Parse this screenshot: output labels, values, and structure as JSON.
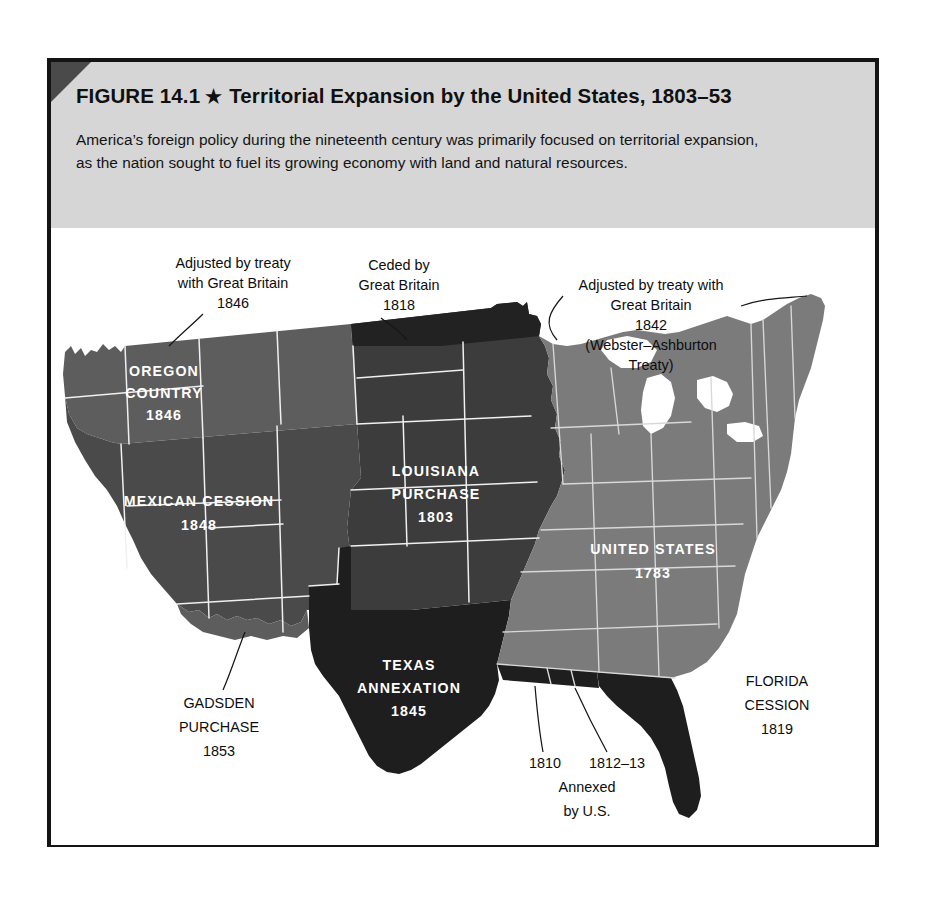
{
  "figure": {
    "number_label": "FIGURE 14.1",
    "star_glyph": "★",
    "title": "Territorial Expansion by the United States, 1803–53",
    "caption": "America’s foreign policy during the nineteenth century was primarily focused on territorial expansion, as the nation sought to fuel its growing economy with land and natural resources."
  },
  "colors": {
    "page_background": "#ffffff",
    "frame_border": "#141414",
    "header_band": "#d6d6d6",
    "corner_wedge": "#4a4a4a",
    "oregon_country": "#5d5d5d",
    "mexican_cession": "#4a4a4a",
    "louisiana_purchase": "#3c3c3c",
    "ceded_1818": "#222222",
    "texas_annexation": "#1e1e1e",
    "florida_cession": "#1e1e1e",
    "gulf_annexed": "#1e1e1e",
    "united_states_1783": "#7b7b7b",
    "state_border": "#f0f0f0",
    "map_label_text": "#ffffff",
    "callout_text": "#0d0d0d"
  },
  "map": {
    "title": "Territorial Expansion by the United States, 1803–53",
    "regions": [
      {
        "id": "oregon-country",
        "name": "OREGON COUNTRY",
        "year": "1846",
        "label_lines": [
          "OREGON",
          "COUNTRY",
          "1846"
        ],
        "shade": "#5d5d5d"
      },
      {
        "id": "mexican-cession",
        "name": "MEXICAN CESSION",
        "year": "1848",
        "label_lines": [
          "MEXICAN CESSION",
          "1848"
        ],
        "shade": "#4a4a4a"
      },
      {
        "id": "louisiana-purchase",
        "name": "LOUISIANA PURCHASE",
        "year": "1803",
        "label_lines": [
          "LOUISIANA",
          "PURCHASE",
          "1803"
        ],
        "shade": "#3c3c3c"
      },
      {
        "id": "texas-annexation",
        "name": "TEXAS ANNEXATION",
        "year": "1845",
        "label_lines": [
          "TEXAS",
          "ANNEXATION",
          "1845"
        ],
        "shade": "#1e1e1e"
      },
      {
        "id": "united-states-1783",
        "name": "UNITED STATES",
        "year": "1783",
        "label_lines": [
          "UNITED STATES",
          "1783"
        ],
        "shade": "#7b7b7b"
      },
      {
        "id": "florida-cession",
        "name": "FLORIDA CESSION",
        "year": "1819",
        "label_lines": [
          "FLORIDA",
          "CESSION",
          "1819"
        ],
        "shade": "#1e1e1e"
      },
      {
        "id": "gadsden-purchase",
        "name": "GADSDEN PURCHASE",
        "year": "1853",
        "label_lines": [
          "GADSDEN",
          "PURCHASE",
          "1853"
        ],
        "shade": "#5d5d5d"
      }
    ],
    "inset_labels": {
      "oregon": {
        "line1": "OREGON",
        "line2": "COUNTRY",
        "line3": "1846"
      },
      "mexican_cession": {
        "line1": "MEXICAN CESSION",
        "line2": "1848"
      },
      "louisiana": {
        "line1": "LOUISIANA",
        "line2": "PURCHASE",
        "line3": "1803"
      },
      "texas": {
        "line1": "TEXAS",
        "line2": "ANNEXATION",
        "line3": "1845"
      },
      "united_states": {
        "line1": "UNITED STATES",
        "line2": "1783"
      }
    },
    "callouts": [
      {
        "id": "treaty-1846",
        "lines": [
          "Adjusted by treaty",
          "with Great Britain",
          "1846"
        ]
      },
      {
        "id": "ceded-1818",
        "lines": [
          "Ceded by",
          "Great Britain",
          "1818"
        ]
      },
      {
        "id": "webster-ashburton-1842",
        "lines": [
          "Adjusted by treaty with",
          "Great Britain",
          "1842",
          "(Webster–Ashburton",
          "Treaty)"
        ]
      },
      {
        "id": "gadsden-purchase",
        "lines": [
          "GADSDEN",
          "PURCHASE",
          "1853"
        ]
      },
      {
        "id": "florida-cession",
        "lines": [
          "FLORIDA",
          "CESSION",
          "1819"
        ]
      },
      {
        "id": "gulf-annexed",
        "lines": [
          "1810",
          "1812–13",
          "Annexed",
          "by U.S."
        ]
      }
    ]
  }
}
